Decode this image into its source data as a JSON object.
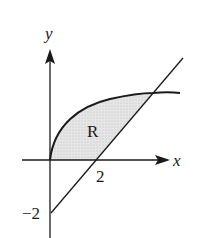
{
  "figure": {
    "type": "region-between-curves",
    "axes": {
      "x_label": "x",
      "y_label": "y"
    },
    "tick_labels": {
      "x_intercept": "2",
      "y_intercept": "−2"
    },
    "region_label": "R",
    "curves": [
      {
        "name": "concave-curve",
        "description": "increasing concave curve starting at origin"
      },
      {
        "name": "line",
        "description": "straight line through (2,0) and (0,-2)"
      }
    ],
    "colors": {
      "stroke": "#1a1a1a",
      "region_fill": "#dcdcdc",
      "background": "#ffffff"
    }
  }
}
